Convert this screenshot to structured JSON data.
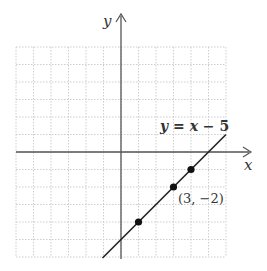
{
  "chart_data": {
    "type": "line",
    "title": "",
    "xlabel": "x",
    "ylabel": "y",
    "xlim": [
      -6,
      6
    ],
    "ylim": [
      -6,
      6
    ],
    "grid": true,
    "grid_step": 1,
    "series": [
      {
        "name": "y = x − 5",
        "equation": "y = x - 5",
        "slope": 1,
        "intercept": -5,
        "x": [
          -1,
          6
        ],
        "y": [
          -6,
          1
        ]
      }
    ],
    "points": [
      {
        "x": 1,
        "y": -4,
        "label": ""
      },
      {
        "x": 3,
        "y": -2,
        "label": "(3, −2)"
      },
      {
        "x": 4,
        "y": -1,
        "label": ""
      }
    ],
    "annotations": [
      {
        "text": "y = x − 5",
        "near": "line upper right"
      },
      {
        "text": "(3, −2)",
        "near": "point (3, -2)"
      }
    ]
  },
  "labels": {
    "x_axis": "x",
    "y_axis": "y",
    "equation_y": "y",
    "equation_eq": " = ",
    "equation_x": "x",
    "equation_rest": " − 5",
    "point_label": "(3, −2)"
  },
  "colors": {
    "axis": "#555555",
    "line": "#222222",
    "grid": "#c8c8c8",
    "point": "#111111",
    "text": "#333333"
  }
}
